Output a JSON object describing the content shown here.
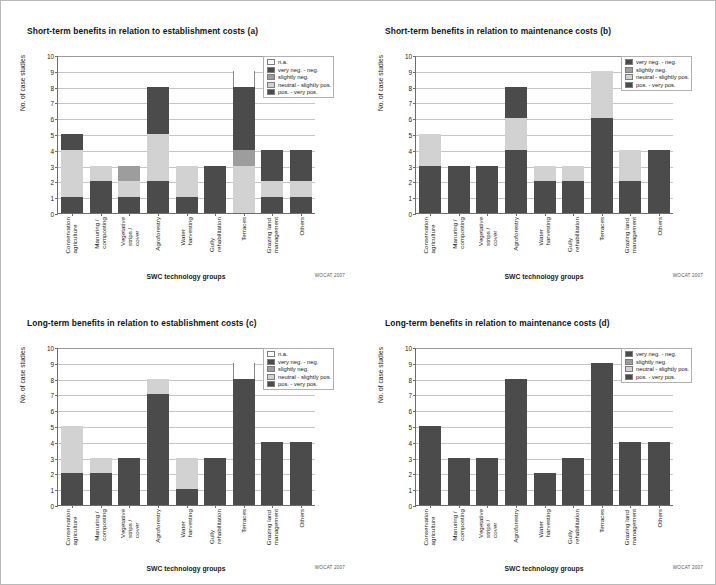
{
  "figure": {
    "credit": "WOCAT 2007",
    "x_axis_title": "SWC technology groups",
    "y_axis_title": "No. of case studies",
    "y_ticks": [
      "10",
      "9",
      "8",
      "7",
      "6",
      "5",
      "4",
      "3",
      "2",
      "1",
      "0"
    ],
    "y_max": 10,
    "categories": [
      "Conservation\nagriculture",
      "Manuring /\ncomposting",
      "Vegetative\nstrips / cover",
      "Agroforestry",
      "Water\nharvesting",
      "Gully\nrehabilitation",
      "Terraces",
      "Grazing land\nmanagement",
      "Others"
    ],
    "colors": {
      "na": "#ffffff",
      "very_neg": "#4b4b4b",
      "slightly_neg": "#9d9d9d",
      "neutral": "#d2d2d2",
      "positive": "#4b4b4b",
      "gridline": "#c6c6c6",
      "axis": "#6d6d6d"
    }
  },
  "chart_data": [
    {
      "id": "a",
      "type": "bar",
      "stacked": true,
      "title": "Short-term benefits in relation to establishment costs (a)",
      "xlabel": "SWC technology groups",
      "ylabel": "No. of case studies",
      "ylim": [
        0,
        10
      ],
      "grid": true,
      "legend_position": "top-right",
      "categories": [
        "Conservation agriculture",
        "Manuring / composting",
        "Vegetative strips / cover",
        "Agroforestry",
        "Water harvesting",
        "Gully rehabilitation",
        "Terraces",
        "Grazing land management",
        "Others"
      ],
      "legend": [
        "n.a.",
        "very neg. - neg.",
        "slightly neg.",
        "neutral - slightly pos.",
        "pos. - very pos."
      ],
      "series": [
        {
          "name": "pos. - very pos.",
          "key": "pos",
          "values": [
            1,
            2,
            1,
            2,
            1,
            3,
            0,
            1,
            1
          ]
        },
        {
          "name": "neutral - slightly pos.",
          "key": "neutral",
          "values": [
            3,
            1,
            1,
            3,
            2,
            0,
            3,
            1,
            1
          ]
        },
        {
          "name": "slightly neg.",
          "key": "sneg",
          "values": [
            0,
            0,
            1,
            0,
            0,
            0,
            1,
            0,
            0
          ]
        },
        {
          "name": "very neg. - neg.",
          "key": "vneg",
          "values": [
            1,
            0,
            0,
            3,
            0,
            0,
            4,
            2,
            2
          ]
        },
        {
          "name": "n.a.",
          "key": "na",
          "values": [
            0,
            0,
            0,
            0,
            0,
            0,
            1,
            0,
            0
          ]
        }
      ],
      "totals": [
        5,
        3,
        3,
        8,
        3,
        3,
        9,
        4,
        4
      ]
    },
    {
      "id": "b",
      "type": "bar",
      "stacked": true,
      "title": "Short-term benefits in relation to maintenance costs (b)",
      "xlabel": "SWC technology groups",
      "ylabel": "No. of case studies",
      "ylim": [
        0,
        10
      ],
      "grid": true,
      "legend_position": "top-right",
      "categories": [
        "Conservation agriculture",
        "Manuring / composting",
        "Vegetative strips / cover",
        "Agroforestry",
        "Water harvesting",
        "Gully rehabilitation",
        "Terraces",
        "Grazing land management",
        "Others"
      ],
      "legend": [
        "very neg. - neg.",
        "slightly neg.",
        "neutral - slightly pos.",
        "pos. - very pos."
      ],
      "series": [
        {
          "name": "pos. - very pos.",
          "key": "pos",
          "values": [
            3,
            3,
            3,
            4,
            2,
            2,
            6,
            2,
            4
          ]
        },
        {
          "name": "neutral - slightly pos.",
          "key": "neutral",
          "values": [
            2,
            0,
            0,
            2,
            1,
            1,
            3,
            2,
            0
          ]
        },
        {
          "name": "slightly neg.",
          "key": "sneg",
          "values": [
            0,
            0,
            0,
            0,
            0,
            0,
            0,
            0,
            0
          ]
        },
        {
          "name": "very neg. - neg.",
          "key": "vneg",
          "values": [
            0,
            0,
            0,
            2,
            0,
            0,
            0,
            0,
            0
          ]
        }
      ],
      "totals": [
        5,
        3,
        3,
        8,
        3,
        3,
        9,
        4,
        4
      ]
    },
    {
      "id": "c",
      "type": "bar",
      "stacked": true,
      "title": "Long-term benefits in relation to establishment costs (c)",
      "xlabel": "SWC technology groups",
      "ylabel": "No. of case studies",
      "ylim": [
        0,
        10
      ],
      "grid": true,
      "legend_position": "top-right",
      "categories": [
        "Conservation agriculture",
        "Manuring / composting",
        "Vegetative strips / cover",
        "Agroforestry",
        "Water harvesting",
        "Gully rehabilitation",
        "Terraces",
        "Grazing land management",
        "Others"
      ],
      "legend": [
        "n.a.",
        "very neg. - neg.",
        "slightly neg.",
        "neutral - slightly pos.",
        "pos. - very pos."
      ],
      "series": [
        {
          "name": "pos. - very pos.",
          "key": "pos",
          "values": [
            2,
            2,
            3,
            7,
            1,
            3,
            8,
            4,
            4
          ]
        },
        {
          "name": "neutral - slightly pos.",
          "key": "neutral",
          "values": [
            3,
            1,
            0,
            1,
            2,
            0,
            0,
            0,
            0
          ]
        },
        {
          "name": "slightly neg.",
          "key": "sneg",
          "values": [
            0,
            0,
            0,
            0,
            0,
            0,
            0,
            0,
            0
          ]
        },
        {
          "name": "very neg. - neg.",
          "key": "vneg",
          "values": [
            0,
            0,
            0,
            0,
            0,
            0,
            0,
            0,
            0
          ]
        },
        {
          "name": "n.a.",
          "key": "na",
          "values": [
            0,
            0,
            0,
            0,
            0,
            0,
            1,
            0,
            0
          ]
        }
      ],
      "totals": [
        5,
        3,
        3,
        8,
        3,
        3,
        9,
        4,
        4
      ]
    },
    {
      "id": "d",
      "type": "bar",
      "stacked": true,
      "title": "Long-term benefits in relation to maintenance costs (d)",
      "xlabel": "SWC technology groups",
      "ylabel": "No. of case studies",
      "ylim": [
        0,
        10
      ],
      "grid": true,
      "legend_position": "top-right",
      "categories": [
        "Conservation agriculture",
        "Manuring / composting",
        "Vegetative strips / cover",
        "Agroforestry",
        "Water harvesting",
        "Gully rehabilitation",
        "Terraces",
        "Grazing land management",
        "Others"
      ],
      "legend": [
        "very neg. - neg.",
        "slightly neg.",
        "neutral - slightly pos.",
        "pos. - very pos."
      ],
      "series": [
        {
          "name": "pos. - very pos.",
          "key": "pos",
          "values": [
            5,
            3,
            3,
            8,
            2,
            3,
            9,
            4,
            4
          ]
        },
        {
          "name": "neutral - slightly pos.",
          "key": "neutral",
          "values": [
            0,
            0,
            0,
            0,
            0,
            0,
            0,
            0,
            0
          ]
        },
        {
          "name": "slightly neg.",
          "key": "sneg",
          "values": [
            0,
            0,
            0,
            0,
            0,
            0,
            0,
            0,
            0
          ]
        },
        {
          "name": "very neg. - neg.",
          "key": "vneg",
          "values": [
            0,
            0,
            0,
            0,
            0,
            0,
            0,
            0,
            0
          ]
        }
      ],
      "totals": [
        5,
        3,
        3,
        8,
        2,
        3,
        9,
        4,
        4
      ]
    }
  ]
}
